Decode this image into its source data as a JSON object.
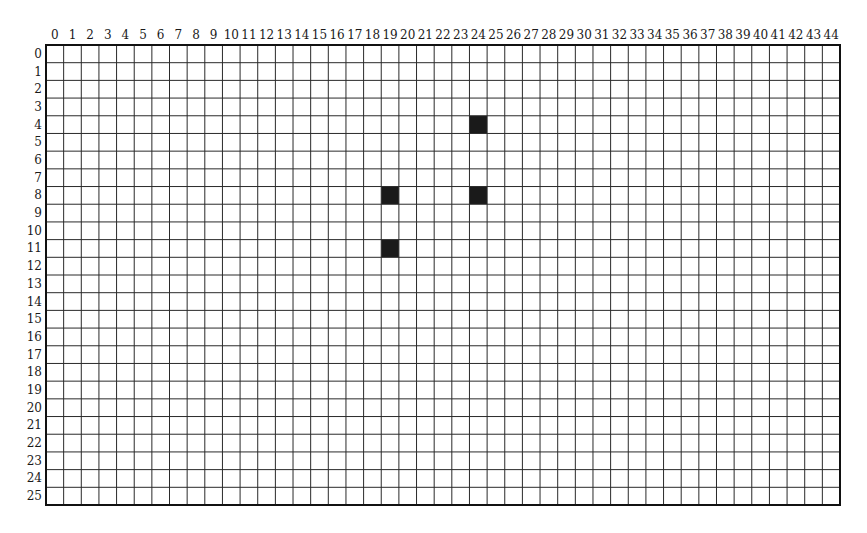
{
  "grid": {
    "columns": 45,
    "rows": 26,
    "column_labels": [
      "0",
      "1",
      "2",
      "3",
      "4",
      "5",
      "6",
      "7",
      "8",
      "9",
      "10",
      "11",
      "12",
      "13",
      "14",
      "15",
      "16",
      "17",
      "18",
      "19",
      "20",
      "21",
      "22",
      "23",
      "24",
      "25",
      "26",
      "27",
      "28",
      "29",
      "30",
      "31",
      "32",
      "33",
      "34",
      "35",
      "36",
      "37",
      "38",
      "39",
      "40",
      "41",
      "42",
      "43",
      "44"
    ],
    "row_labels": [
      "0",
      "1",
      "2",
      "3",
      "4",
      "5",
      "6",
      "7",
      "8",
      "9",
      "10",
      "11",
      "12",
      "13",
      "14",
      "15",
      "16",
      "17",
      "18",
      "19",
      "20",
      "21",
      "22",
      "23",
      "24",
      "25"
    ],
    "filled_cells": [
      {
        "col": 24,
        "row": 4
      },
      {
        "col": 19,
        "row": 8
      },
      {
        "col": 24,
        "row": 8
      },
      {
        "col": 19,
        "row": 11
      }
    ],
    "colors": {
      "line": "#2a2a2a",
      "border": "#111111",
      "fill": "#1a1a1a",
      "background": "#ffffff"
    },
    "geometry": {
      "left": 46,
      "top": 45,
      "right": 840,
      "bottom": 505
    }
  }
}
